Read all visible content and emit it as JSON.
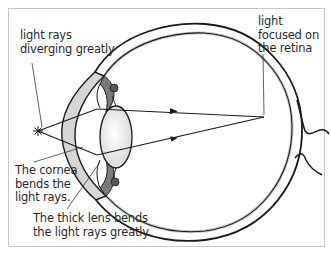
{
  "diagram": {
    "colors": {
      "outline": "#1a1a1a",
      "frame_border": "#c8c8c8",
      "cornea_fill": "#d9d9d9",
      "lens_fill": "#f2f2f2",
      "text": "#2a2a2a"
    },
    "labels": {
      "diverging": [
        "light rays",
        "diverging greatly"
      ],
      "focused": [
        "light",
        "focused on",
        "the retina"
      ],
      "cornea": [
        "The cornea",
        "bends the",
        "light rays."
      ],
      "lens": [
        "The thick lens bends",
        "the light rays greatly."
      ]
    },
    "elements": [
      {
        "name": "light-source-star",
        "label": "point light source"
      },
      {
        "name": "cornea",
        "label": "cornea"
      },
      {
        "name": "lens",
        "label": "thick lens"
      },
      {
        "name": "retina",
        "label": "retina"
      },
      {
        "name": "optic-nerve",
        "label": "optic nerve"
      },
      {
        "name": "light-rays",
        "label": "two rays converging on retina, with arrowheads"
      }
    ]
  }
}
